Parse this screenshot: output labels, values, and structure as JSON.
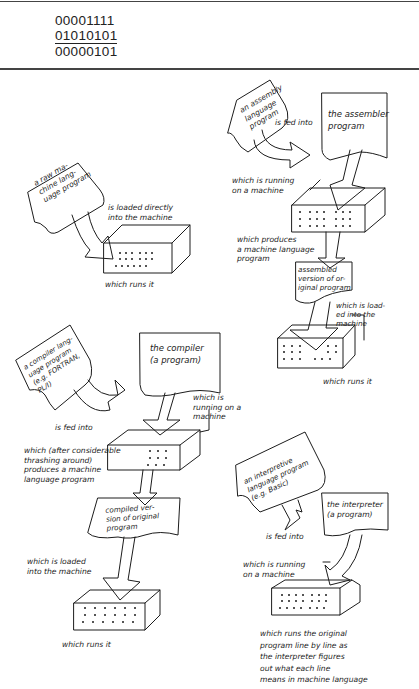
{
  "binary_example": {
    "rows": [
      "00001111",
      "01010101",
      "00000101"
    ],
    "operation_line_after_row": 2
  },
  "diagrams": {
    "raw_machine_language": {
      "program_card": "a raw ma-\nchine lang-\nuage program",
      "action": "is loaded directly\ninto the machine",
      "result": "which runs it"
    },
    "assembly": {
      "program_card": "an assembly\nlanguage\nprogram",
      "action": "is fed into",
      "processor_card": "the assembler\nprogram",
      "processor_note": "which is running\non a machine",
      "produces": "which produces\na machine language\nprogram",
      "output_card": "assembled\nversion of or-\niginal program",
      "load_note": "which is load-\ned into the\nmachine",
      "result": "which runs it"
    },
    "compiler": {
      "program_card": "a compiler lang-\nuage program\n(e.g. FORTRAN,\nPL/I)",
      "action": "is fed into",
      "processor_card": "the compiler\n(a program)",
      "processor_note": "which is\nrunning on a\nmachine",
      "produces": "which (after considerable\nthrashing around)\nproduces a machine\nlanguage program",
      "output_card": "compiled ver-\nsion of original\nprogram",
      "load_note": "which is loaded\ninto the machine",
      "result": "which runs it"
    },
    "interpreter": {
      "program_card": "an interpretive\nlanguage program\n(e.g. Basic)",
      "action": "is fed into",
      "processor_card": "the interpreter\n(a program)",
      "processor_note": "which is running\non a machine",
      "result": "which runs the original\nprogram line by line as\nthe interpreter figures\nout what each line\nmeans in machine language"
    }
  },
  "colors": {
    "ink": "#1c1c1c",
    "paper": "#ffffff",
    "rule": "#444444"
  }
}
